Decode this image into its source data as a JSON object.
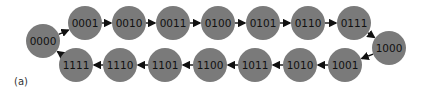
{
  "diagram": {
    "caption": "(a)",
    "node_color": "#7a7a7a",
    "edge_color": "#111111",
    "nodes": [
      {
        "label": "0000",
        "x": 43,
        "y": 41
      },
      {
        "label": "0001",
        "x": 85,
        "y": 23
      },
      {
        "label": "0010",
        "x": 129,
        "y": 23
      },
      {
        "label": "0011",
        "x": 173,
        "y": 23
      },
      {
        "label": "0100",
        "x": 218,
        "y": 23
      },
      {
        "label": "0101",
        "x": 263,
        "y": 23
      },
      {
        "label": "0110",
        "x": 308,
        "y": 23
      },
      {
        "label": "0111",
        "x": 354,
        "y": 23
      },
      {
        "label": "1000",
        "x": 389,
        "y": 48
      },
      {
        "label": "1001",
        "x": 345,
        "y": 65
      },
      {
        "label": "1010",
        "x": 300,
        "y": 65
      },
      {
        "label": "1011",
        "x": 255,
        "y": 65
      },
      {
        "label": "1100",
        "x": 210,
        "y": 65
      },
      {
        "label": "1101",
        "x": 165,
        "y": 65
      },
      {
        "label": "1110",
        "x": 120,
        "y": 65
      },
      {
        "label": "1111",
        "x": 76,
        "y": 65
      }
    ],
    "edges": [
      [
        0,
        1
      ],
      [
        1,
        2
      ],
      [
        2,
        3
      ],
      [
        3,
        4
      ],
      [
        4,
        5
      ],
      [
        5,
        6
      ],
      [
        6,
        7
      ],
      [
        7,
        8
      ],
      [
        8,
        9
      ],
      [
        9,
        10
      ],
      [
        10,
        11
      ],
      [
        11,
        12
      ],
      [
        12,
        13
      ],
      [
        13,
        14
      ],
      [
        14,
        15
      ],
      [
        15,
        0
      ]
    ]
  }
}
